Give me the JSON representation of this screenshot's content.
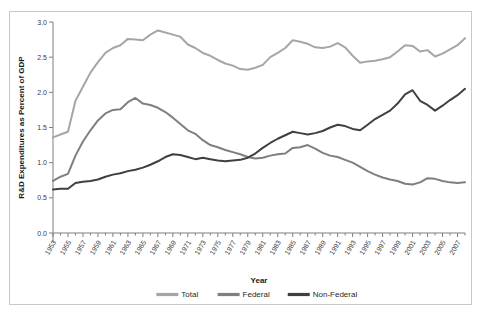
{
  "chart_data": {
    "type": "line",
    "title": "",
    "xlabel": "Year",
    "ylabel": "R&D Expenditures as Percent of GDP",
    "ylim": [
      0.0,
      3.0
    ],
    "ytick_labels": [
      "0.0",
      "0.5",
      "1.0",
      "1.5",
      "2.0",
      "2.5",
      "3.0"
    ],
    "ytick_values": [
      0.0,
      0.5,
      1.0,
      1.5,
      2.0,
      2.5,
      3.0
    ],
    "xlim": [
      1953,
      2008
    ],
    "grid": false,
    "legend_position": "bottom",
    "x": [
      1953,
      1954,
      1955,
      1956,
      1957,
      1958,
      1959,
      1960,
      1961,
      1962,
      1963,
      1964,
      1965,
      1966,
      1967,
      1968,
      1969,
      1970,
      1971,
      1972,
      1973,
      1974,
      1975,
      1976,
      1977,
      1978,
      1979,
      1980,
      1981,
      1982,
      1983,
      1984,
      1985,
      1986,
      1987,
      1988,
      1989,
      1990,
      1991,
      1992,
      1993,
      1994,
      1995,
      1996,
      1997,
      1998,
      1999,
      2000,
      2001,
      2002,
      2003,
      2004,
      2005,
      2006,
      2007,
      2008
    ],
    "xtick_labels": [
      "1953",
      "1955",
      "1957",
      "1959",
      "1961",
      "1963",
      "1965",
      "1967",
      "1969",
      "1971",
      "1973",
      "1975",
      "1977",
      "1979",
      "1981",
      "1983",
      "1985",
      "1987",
      "1989",
      "1991",
      "1993",
      "1995",
      "1997",
      "1999",
      "2001",
      "2003",
      "2005",
      "2007"
    ],
    "series": [
      {
        "name": "Total",
        "color": "#a6a6a6",
        "values": [
          1.36,
          1.4,
          1.44,
          1.88,
          2.08,
          2.28,
          2.43,
          2.56,
          2.63,
          2.67,
          2.76,
          2.75,
          2.74,
          2.82,
          2.88,
          2.85,
          2.82,
          2.79,
          2.68,
          2.63,
          2.56,
          2.52,
          2.46,
          2.41,
          2.38,
          2.33,
          2.32,
          2.35,
          2.39,
          2.5,
          2.56,
          2.63,
          2.74,
          2.72,
          2.69,
          2.64,
          2.63,
          2.65,
          2.7,
          2.64,
          2.52,
          2.42,
          2.44,
          2.45,
          2.47,
          2.5,
          2.58,
          2.67,
          2.66,
          2.58,
          2.6,
          2.51,
          2.55,
          2.61,
          2.67,
          2.77
        ]
      },
      {
        "name": "Federal",
        "color": "#7f7f7f",
        "values": [
          0.74,
          0.8,
          0.84,
          1.1,
          1.3,
          1.46,
          1.6,
          1.7,
          1.75,
          1.76,
          1.86,
          1.92,
          1.84,
          1.82,
          1.78,
          1.72,
          1.64,
          1.55,
          1.46,
          1.41,
          1.32,
          1.25,
          1.22,
          1.18,
          1.15,
          1.12,
          1.08,
          1.06,
          1.07,
          1.1,
          1.12,
          1.13,
          1.21,
          1.22,
          1.25,
          1.2,
          1.14,
          1.1,
          1.08,
          1.04,
          1.0,
          0.94,
          0.88,
          0.83,
          0.79,
          0.76,
          0.74,
          0.7,
          0.69,
          0.72,
          0.78,
          0.77,
          0.74,
          0.72,
          0.71,
          0.72
        ]
      },
      {
        "name": "Non-Federal",
        "color": "#404040",
        "values": [
          0.62,
          0.63,
          0.63,
          0.71,
          0.73,
          0.74,
          0.76,
          0.8,
          0.83,
          0.85,
          0.88,
          0.9,
          0.93,
          0.97,
          1.02,
          1.08,
          1.12,
          1.11,
          1.08,
          1.05,
          1.07,
          1.05,
          1.03,
          1.02,
          1.03,
          1.04,
          1.07,
          1.13,
          1.21,
          1.28,
          1.34,
          1.39,
          1.44,
          1.42,
          1.4,
          1.42,
          1.45,
          1.5,
          1.54,
          1.52,
          1.48,
          1.46,
          1.54,
          1.62,
          1.68,
          1.74,
          1.84,
          1.97,
          2.03,
          1.88,
          1.82,
          1.74,
          1.81,
          1.89,
          1.96,
          2.05
        ]
      }
    ],
    "legend": [
      {
        "label": "Total",
        "color": "#a6a6a6"
      },
      {
        "label": "Federal",
        "color": "#7f7f7f"
      },
      {
        "label": "Non-Federal",
        "color": "#404040"
      }
    ]
  }
}
